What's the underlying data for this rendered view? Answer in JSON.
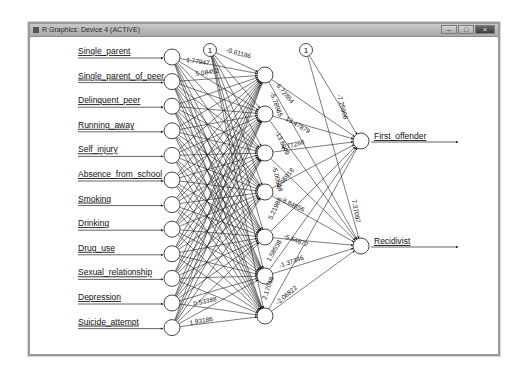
{
  "window": {
    "title": "R Graphics: Device 4 (ACTIVE)",
    "buttons": {
      "minimize": "–",
      "maximize": "□",
      "close": "×"
    }
  },
  "network": {
    "inputs": [
      "Single_parent",
      "Single_parent_of_peer",
      "Delinquent_peer",
      "Running_away",
      "Self_injury",
      "Absence_from_school",
      "Smoking",
      "Drinking",
      "Drug_use",
      "Sexual_relationship",
      "Depression",
      "Suicide_attempt"
    ],
    "hidden_count": 7,
    "outputs": [
      "First_offender",
      "Recidivist"
    ],
    "bias_label": "1",
    "visible_weights": {
      "bias_to_hidden1": "-0.61186",
      "input1_to_hidden1": "1.77947",
      "input2_label": "5.08452",
      "input12_to_hidden": "1.93186",
      "input11_label": "0.53388",
      "hidden1_to_first": "6.72864",
      "hidden1_to_recid": "-5.78985",
      "hidden2_to_first": "13.47879",
      "hidden2_to_recid": "-13.6049",
      "hidden3_to_first": "4.77268",
      "hidden3_to_recid": "-5.00518",
      "hidden4_to_first": "-6.46918",
      "hidden4_to_recid": "8.84856",
      "hidden5_to_first": "5.21988",
      "hidden5_to_recid": "-5.54872",
      "hidden6_to_first": "1.58538",
      "hidden6_to_recid": "-1.37346",
      "hidden7_to_first": "2.17048",
      "hidden7_to_recid": "-2.06822",
      "bias2_to_first": "-7.25906",
      "bias2_to_recid": "7.37097"
    }
  }
}
